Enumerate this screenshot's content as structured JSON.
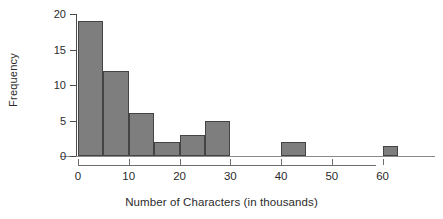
{
  "chart_data": {
    "type": "bar",
    "subtype": "histogram",
    "title": "",
    "xlabel": "Number of Characters (in thousands)",
    "ylabel": "Frequency",
    "xlim": [
      0,
      65
    ],
    "ylim": [
      0,
      20
    ],
    "xticks": [
      0,
      10,
      20,
      30,
      40,
      50,
      60
    ],
    "xtick_labels": [
      "0",
      "10",
      "20",
      "30",
      "40",
      "50",
      "60"
    ],
    "yticks": [
      0,
      5,
      10,
      15,
      20
    ],
    "ytick_labels": [
      "0",
      "5",
      "10",
      "15",
      "20"
    ],
    "grid": false,
    "legend": null,
    "bin_width": 5,
    "bars": [
      {
        "bin_start": 0,
        "bin_end": 5,
        "value": 19
      },
      {
        "bin_start": 5,
        "bin_end": 10,
        "value": 12
      },
      {
        "bin_start": 10,
        "bin_end": 15,
        "value": 6
      },
      {
        "bin_start": 15,
        "bin_end": 20,
        "value": 2
      },
      {
        "bin_start": 20,
        "bin_end": 25,
        "value": 3
      },
      {
        "bin_start": 25,
        "bin_end": 30,
        "value": 5
      },
      {
        "bin_start": 40,
        "bin_end": 45,
        "value": 2
      },
      {
        "bin_start": 60,
        "bin_end": 63,
        "value": 1.4
      }
    ],
    "categories": [
      "0-5",
      "5-10",
      "10-15",
      "15-20",
      "20-25",
      "25-30",
      "40-45",
      "60-63"
    ],
    "values": [
      19,
      12,
      6,
      2,
      3,
      5,
      2,
      1.4
    ],
    "colors": {
      "bar_fill": "#7e7e7e",
      "bar_edge": "#444444",
      "axis": "#4a4a4a",
      "text": "#2b2b2b",
      "background": "#ffffff"
    }
  }
}
